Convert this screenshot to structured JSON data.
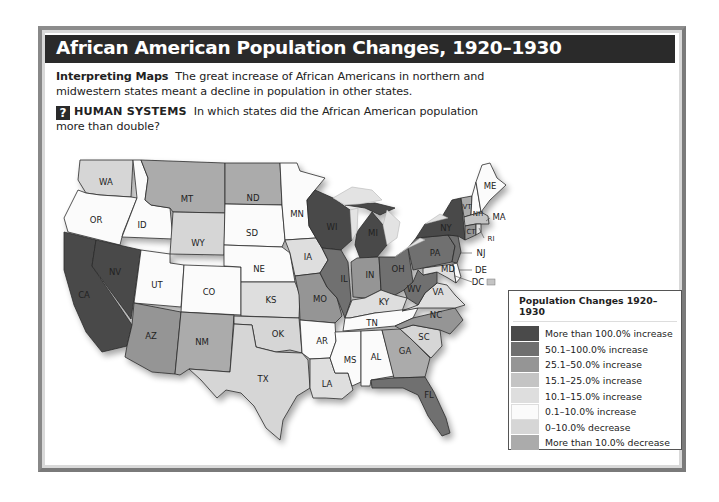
{
  "header": {
    "title": "African American Population Changes, 1920–1930"
  },
  "intro": {
    "heading": "Interpreting Maps",
    "text": "The great increase of African Americans in northern and midwestern states meant a decline in population in other states."
  },
  "question": {
    "icon": "question-mark-icon",
    "icon_glyph": "?",
    "category": "HUMAN SYSTEMS",
    "text": "In which states did the African American population more than double?"
  },
  "legend": {
    "title": "Population Changes 1920–1930",
    "items": [
      {
        "label": "More than 100.0% increase",
        "color": "#4a4a4a"
      },
      {
        "label": "50.1–100.0% increase",
        "color": "#6f6f6f"
      },
      {
        "label": "25.1–50.0% increase",
        "color": "#959595"
      },
      {
        "label": "15.1–25.0% increase",
        "color": "#c4c4c4"
      },
      {
        "label": "10.1–15.0% increase",
        "color": "#dedede"
      },
      {
        "label": "0.1–10.0% increase",
        "color": "#fbfbfb"
      },
      {
        "label": "0–10.0% decrease",
        "color": "#d6d6d6"
      },
      {
        "label": "More than 10.0% decrease",
        "color": "#ababab"
      }
    ]
  },
  "states": {
    "WA": {
      "label": "WA",
      "category": "0–10.0% decrease"
    },
    "OR": {
      "label": "OR",
      "category": "0.1–10.0% increase"
    },
    "CA": {
      "label": "CA",
      "category": "More than 100.0% increase"
    },
    "NV": {
      "label": "NV",
      "category": "More than 100.0% increase"
    },
    "ID": {
      "label": "ID",
      "category": "0.1–10.0% increase"
    },
    "MT": {
      "label": "MT",
      "category": "More than 10.0% decrease"
    },
    "WY": {
      "label": "WY",
      "category": "0–10.0% decrease"
    },
    "UT": {
      "label": "UT",
      "category": "0.1–10.0% increase"
    },
    "CO": {
      "label": "CO",
      "category": "0.1–10.0% increase"
    },
    "AZ": {
      "label": "AZ",
      "category": "25.1–50.0% increase"
    },
    "NM": {
      "label": "NM",
      "category": "More than 10.0% decrease"
    },
    "ND": {
      "label": "ND",
      "category": "More than 10.0% decrease"
    },
    "SD": {
      "label": "SD",
      "category": "0.1–10.0% increase"
    },
    "NE": {
      "label": "NE",
      "category": "0.1–10.0% increase"
    },
    "KS": {
      "label": "KS",
      "category": "10.1–15.0% increase"
    },
    "OK": {
      "label": "OK",
      "category": "0–10.0% decrease"
    },
    "TX": {
      "label": "TX",
      "category": "0–10.0% decrease"
    },
    "MN": {
      "label": "MN",
      "category": "0.1–10.0% increase"
    },
    "IA": {
      "label": "IA",
      "category": "10.1–15.0% increase"
    },
    "MO": {
      "label": "MO",
      "category": "25.1–50.0% increase"
    },
    "AR": {
      "label": "AR",
      "category": "0.1–10.0% increase"
    },
    "LA": {
      "label": "LA",
      "category": "10.1–15.0% increase"
    },
    "WI": {
      "label": "WI",
      "category": "More than 100.0% increase"
    },
    "IL": {
      "label": "IL",
      "category": "50.1–100.0% increase"
    },
    "MI": {
      "label": "MI",
      "category": "More than 100.0% increase"
    },
    "IN": {
      "label": "IN",
      "category": "25.1–50.0% increase"
    },
    "OH": {
      "label": "OH",
      "category": "50.1–100.0% increase"
    },
    "KY": {
      "label": "KY",
      "category": "10.1–15.0% increase"
    },
    "TN": {
      "label": "TN",
      "category": "0.1–10.0% increase"
    },
    "MS": {
      "label": "MS",
      "category": "0.1–10.0% increase"
    },
    "AL": {
      "label": "AL",
      "category": "0.1–10.0% increase"
    },
    "GA": {
      "label": "GA",
      "category": "More than 10.0% decrease"
    },
    "FL": {
      "label": "FL",
      "category": "50.1–100.0% increase"
    },
    "SC": {
      "label": "SC",
      "category": "0–10.0% decrease"
    },
    "NC": {
      "label": "NC",
      "category": "25.1–50.0% increase"
    },
    "VA": {
      "label": "VA",
      "category": "10.1–15.0% increase"
    },
    "WV": {
      "label": "WV",
      "category": "50.1–100.0% increase"
    },
    "PA": {
      "label": "PA",
      "category": "50.1–100.0% increase"
    },
    "NY": {
      "label": "NY",
      "category": "More than 100.0% increase"
    },
    "NJ": {
      "label": "NJ",
      "category": "50.1–100.0% increase"
    },
    "DE": {
      "label": "DE",
      "category": "0.1–10.0% increase"
    },
    "MD": {
      "label": "MD",
      "category": "10.1–15.0% increase"
    },
    "DC": {
      "label": "DC",
      "category": "15.1–25.0% increase"
    },
    "VT": {
      "label": "VT",
      "category": "More than 10.0% decrease"
    },
    "NH": {
      "label": "NH",
      "category": "0.1–10.0% increase"
    },
    "ME": {
      "label": "ME",
      "category": "0.1–10.0% increase"
    },
    "MA": {
      "label": "MA",
      "category": "15.1–25.0% increase"
    },
    "CT": {
      "label": "CT",
      "category": "25.1–50.0% increase"
    },
    "RI": {
      "label": "RI",
      "category": "10.1–15.0% increase"
    }
  }
}
